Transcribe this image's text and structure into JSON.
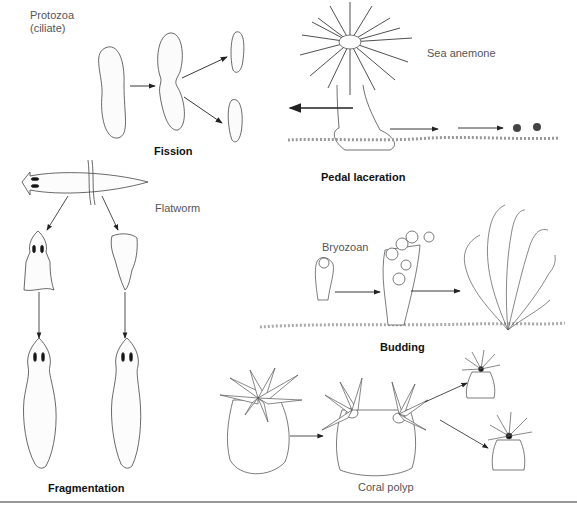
{
  "figure": {
    "labels": {
      "protozoa": "Protozoa\n(ciliate)",
      "sea_anemone": "Sea anemone",
      "flatworm": "Flatworm",
      "bryozoan": "Bryozoan",
      "coral_polyp": "Coral polyp"
    },
    "titles": {
      "fission": "Fission",
      "pedal_laceration": "Pedal laceration",
      "budding": "Budding",
      "fragmentation": "Fragmentation"
    }
  }
}
